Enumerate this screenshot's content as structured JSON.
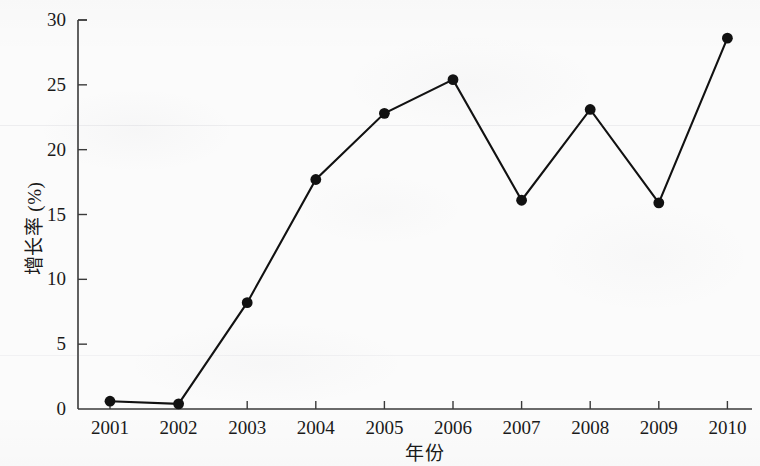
{
  "chart_data": {
    "type": "line",
    "title": "",
    "subtitle": "",
    "xlabel": "年份",
    "ylabel": "增长率 (%)",
    "categories": [
      "2001",
      "2002",
      "2003",
      "2004",
      "2005",
      "2006",
      "2007",
      "2008",
      "2009",
      "2010"
    ],
    "values": [
      0.6,
      0.4,
      8.2,
      17.7,
      22.8,
      25.4,
      16.1,
      23.1,
      15.9,
      28.6
    ],
    "series": [
      {
        "name": "增长率",
        "values": [
          0.6,
          0.4,
          8.2,
          17.7,
          22.8,
          25.4,
          16.1,
          23.1,
          15.9,
          28.6
        ]
      }
    ],
    "xlim": [
      2000.5,
      2010.5
    ],
    "ylim": [
      0,
      30
    ],
    "yticks": [
      "0",
      "5",
      "10",
      "15",
      "20",
      "25",
      "30"
    ],
    "ytick_values": [
      0,
      5,
      10,
      15,
      20,
      25,
      30
    ],
    "xticks": [
      "2001",
      "2002",
      "2003",
      "2004",
      "2005",
      "2006",
      "2007",
      "2008",
      "2009",
      "2010"
    ],
    "grid": false,
    "legend": null,
    "legend_position": "none",
    "marker": "filled-circle",
    "line_color": "#111111",
    "marker_color": "#111111",
    "background_color": "#fbfbfb",
    "axis_color": "#3a3a3a",
    "annotations": []
  }
}
